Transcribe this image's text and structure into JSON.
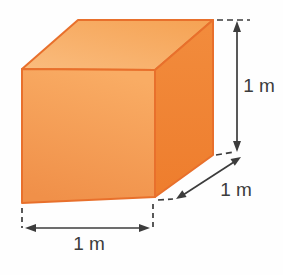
{
  "figure": {
    "type": "3d-cube-diagram",
    "unit": "m",
    "edge_length": "1",
    "dimensions": {
      "width_label": "1 m",
      "depth_label": "1 m",
      "height_label": "1 m"
    }
  },
  "colors": {
    "background": "#FEFEFE",
    "top_face_light": "#FABC7E",
    "top_face_dark": "#F5A253",
    "front_face_light": "#F9AC64",
    "front_face_dark": "#F09049",
    "right_face_light": "#F28C3D",
    "right_face_dark": "#EE7D2D",
    "edge": "#E8702C",
    "dimension": "#3C3C3C"
  }
}
